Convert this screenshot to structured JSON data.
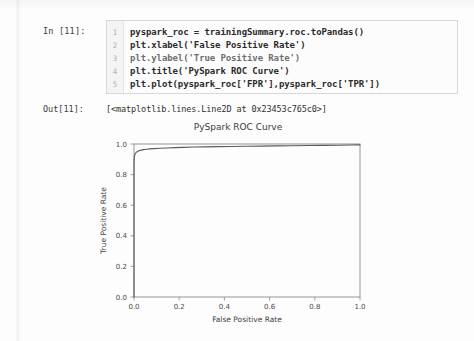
{
  "page": {
    "background_color": "#fdfdfd"
  },
  "notebook": {
    "input_prompt": "In [11]:",
    "output_prompt": "Out[11]:",
    "output_text": "[<matplotlib.lines.Line2D at 0x23453c765c0>]",
    "line_numbers": [
      "1",
      "2",
      "3",
      "4",
      "5"
    ],
    "code_lines": [
      "pyspark_roc = trainingSummary.roc.toPandas()",
      "plt.xlabel('False Positive Rate')",
      "plt.ylabel('True Positive Rate')",
      "plt.title('PySpark ROC Curve')",
      "plt.plot(pyspark_roc['FPR'],pyspark_roc['TPR'])"
    ]
  },
  "chart_data": {
    "type": "line",
    "title": "PySpark ROC Curve",
    "xlabel": "False Positive Rate",
    "ylabel": "True Positive Rate",
    "xlim": [
      0.0,
      1.0
    ],
    "ylim": [
      0.0,
      1.0
    ],
    "xticks": [
      0.0,
      0.2,
      0.4,
      0.6,
      0.8,
      1.0
    ],
    "yticks": [
      0.0,
      0.2,
      0.4,
      0.6,
      0.8,
      1.0
    ],
    "xtick_labels": [
      "0.0",
      "0.2",
      "0.4",
      "0.6",
      "0.8",
      "1.0"
    ],
    "ytick_labels": [
      "0.0",
      "0.2",
      "0.4",
      "0.6",
      "0.8",
      "1.0"
    ],
    "grid": false,
    "legend": null,
    "line_color": "#5b5b5b",
    "series": [
      {
        "name": "ROC",
        "x": [
          0.0,
          0.0,
          0.001,
          0.002,
          0.004,
          0.006,
          0.009,
          0.013,
          0.018,
          0.024,
          0.032,
          0.042,
          0.055,
          0.07,
          0.09,
          0.115,
          0.145,
          0.18,
          0.22,
          0.265,
          0.315,
          0.37,
          0.43,
          0.495,
          0.56,
          0.63,
          0.7,
          0.77,
          0.84,
          0.905,
          0.96,
          1.0
        ],
        "y": [
          0.0,
          0.87,
          0.905,
          0.92,
          0.93,
          0.938,
          0.944,
          0.949,
          0.953,
          0.957,
          0.96,
          0.963,
          0.966,
          0.968,
          0.97,
          0.972,
          0.974,
          0.976,
          0.978,
          0.98,
          0.981,
          0.983,
          0.984,
          0.985,
          0.986,
          0.988,
          0.989,
          0.99,
          0.991,
          0.992,
          0.993,
          0.994
        ]
      }
    ]
  }
}
